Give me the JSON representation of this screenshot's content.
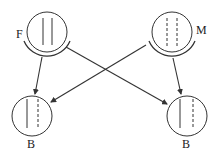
{
  "diagram": {
    "type": "inheritance-cross",
    "colors": {
      "stroke": "#333333",
      "background": "#ffffff"
    },
    "nodes": [
      {
        "id": "F",
        "label": "F",
        "cx": 47,
        "cy": 32,
        "r": 20,
        "chromatids": [
          "solid",
          "solid"
        ],
        "has_outer_arc": true,
        "label_x": 20,
        "label_y": 38
      },
      {
        "id": "M",
        "label": "M",
        "cx": 172,
        "cy": 32,
        "r": 20,
        "chromatids": [
          "dashed",
          "dashed"
        ],
        "has_outer_arc": true,
        "label_x": 200,
        "label_y": 33
      },
      {
        "id": "B1",
        "label": "B",
        "cx": 32,
        "cy": 116,
        "r": 20,
        "chromatids": [
          "solid",
          "dashed"
        ],
        "has_outer_arc": false,
        "label_x": 32,
        "label_y": 149
      },
      {
        "id": "B2",
        "label": "B",
        "cx": 187,
        "cy": 116,
        "r": 20,
        "chromatids": [
          "solid",
          "dashed"
        ],
        "has_outer_arc": false,
        "label_x": 187,
        "label_y": 149
      }
    ],
    "edges": [
      {
        "from": "F",
        "to": "B1"
      },
      {
        "from": "F",
        "to": "B2"
      },
      {
        "from": "M",
        "to": "B1"
      },
      {
        "from": "M",
        "to": "B2"
      }
    ]
  },
  "labels": {
    "father": "F",
    "mother": "M",
    "child_left": "B",
    "child_right": "B"
  }
}
